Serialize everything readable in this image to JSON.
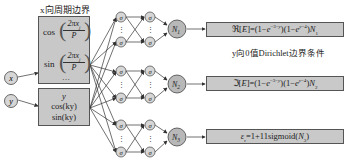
{
  "labels": {
    "x_periodic": "x向周期边界",
    "y_dirichlet": "y向0值Dirichlet边界条件"
  },
  "inputs": [
    {
      "name": "x"
    },
    {
      "name": "y"
    }
  ],
  "x_features": {
    "cos": "cos",
    "sin": "sin",
    "num": "2πx",
    "sub": "j",
    "den": "P",
    "ellipsis": "…"
  },
  "y_features": [
    "y",
    "cos(ky)",
    "sin(ky)"
  ],
  "hidden_node": "σ",
  "outputs": [
    {
      "node": "N",
      "sub": "1",
      "formula": "ℜ[E]=(1−e^{−3−y})(1−e^{y−4})N₁",
      "display": "ℜ[E]=(1−e−3−y)(1−ey−4)N1"
    },
    {
      "node": "N",
      "sub": "2",
      "formula": "ℑ[E]=(1−e^{−3−y})(1−e^{y−4})N₂",
      "display": "ℑ[E]=(1−e−3−y)(1−ey−4)N2"
    },
    {
      "node": "N",
      "sub": "3",
      "formula": "ε_r=1+11sigmoid(N₃)",
      "display": "εr=1+11sigmoid(N3)"
    }
  ],
  "colors": {
    "box_fill": "#c8c8c8",
    "node_fill": "#d6d6d6",
    "output_node_fill": "#b8b8b8",
    "stroke": "#444444"
  }
}
